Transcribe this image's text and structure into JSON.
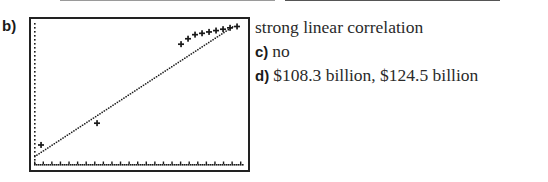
{
  "parts": {
    "b": {
      "label": "b)",
      "answer": "strong linear correlation"
    },
    "c": {
      "label": "c)",
      "answer": "no"
    },
    "d": {
      "label": "d)",
      "answer": "$108.3 billion, $124.5 billion"
    }
  },
  "chart_data": {
    "type": "scatter",
    "title": "",
    "xlabel": "",
    "ylabel": "",
    "grid": false,
    "legend": null,
    "style": "graphing-calculator screen with dotted axes and dotted regression line",
    "points": [
      {
        "x": 1,
        "y": 1.4
      },
      {
        "x": 9,
        "y": 3.0
      },
      {
        "x": 21,
        "y": 8.8
      },
      {
        "x": 22,
        "y": 9.2
      },
      {
        "x": 23,
        "y": 9.5
      },
      {
        "x": 24,
        "y": 9.6
      },
      {
        "x": 25,
        "y": 9.7
      },
      {
        "x": 26,
        "y": 9.8
      },
      {
        "x": 27,
        "y": 9.9
      },
      {
        "x": 28,
        "y": 10.0
      },
      {
        "x": 29,
        "y": 10.1
      }
    ],
    "regression_line": {
      "x": [
        0,
        28.5
      ],
      "y": [
        0.6,
        10.2
      ]
    },
    "xlim": [
      0,
      30
    ],
    "ylim": [
      0,
      10.5
    ],
    "x_tick_count": 24,
    "y_tick_count": 13
  },
  "colors": {
    "ink": "#1a1a1a",
    "frame": "#222222",
    "rule": "#9a9a9a",
    "background": "#ffffff"
  }
}
